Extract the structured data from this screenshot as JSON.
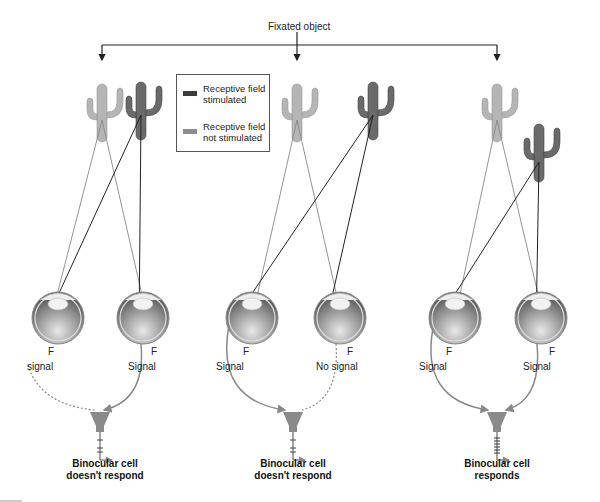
{
  "title": "Fixated object",
  "legend": {
    "items": [
      {
        "label_line1": "Receptive field",
        "label_line2": "stimulated",
        "color": "#3c3c3c"
      },
      {
        "label_line1": "Receptive field",
        "label_line2": "not stimulated",
        "color": "#8c8c8c"
      }
    ]
  },
  "panels": [
    {
      "left_eye_label": "signal",
      "right_eye_label": "Signal",
      "fovea_left": "F",
      "fovea_right": "F",
      "caption_line1": "Binocular cell",
      "caption_line2": "doesn't respond"
    },
    {
      "left_eye_label": "Signal",
      "right_eye_label": "No signal",
      "fovea_left": "F",
      "fovea_right": "F",
      "caption_line1": "Binocular cell",
      "caption_line2": "doesn't respond"
    },
    {
      "left_eye_label": "Signal",
      "right_eye_label": "Signal",
      "fovea_left": "F",
      "fovea_right": "F",
      "caption_line1": "Binocular cell",
      "caption_line2": "responds"
    }
  ],
  "colors": {
    "stimulated": "#3c3c3c",
    "not_stimulated": "#8c8c8c",
    "line_dark": "#222222",
    "line_gray": "#888888",
    "neuron": "#8a8a8a"
  }
}
